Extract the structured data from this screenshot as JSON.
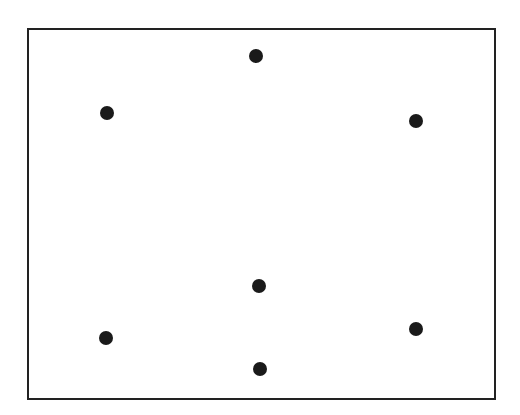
{
  "diagram": {
    "width": 520,
    "height": 415,
    "colors": {
      "background": "#ffffff",
      "stroke": "#222222",
      "dot": "#1a1a1a"
    },
    "frame": {
      "x1": 28,
      "y1": 29,
      "x2": 495,
      "y2": 399,
      "stroke_width": 2
    },
    "dot_radius": 7,
    "dots": [
      {
        "id": "top-center",
        "x": 256,
        "y": 56
      },
      {
        "id": "upper-left",
        "x": 107,
        "y": 113
      },
      {
        "id": "upper-right",
        "x": 416,
        "y": 121
      },
      {
        "id": "middle-center",
        "x": 259,
        "y": 286
      },
      {
        "id": "lower-right",
        "x": 416,
        "y": 329
      },
      {
        "id": "lower-left",
        "x": 106,
        "y": 338
      },
      {
        "id": "bottom-center",
        "x": 260,
        "y": 369
      }
    ]
  }
}
